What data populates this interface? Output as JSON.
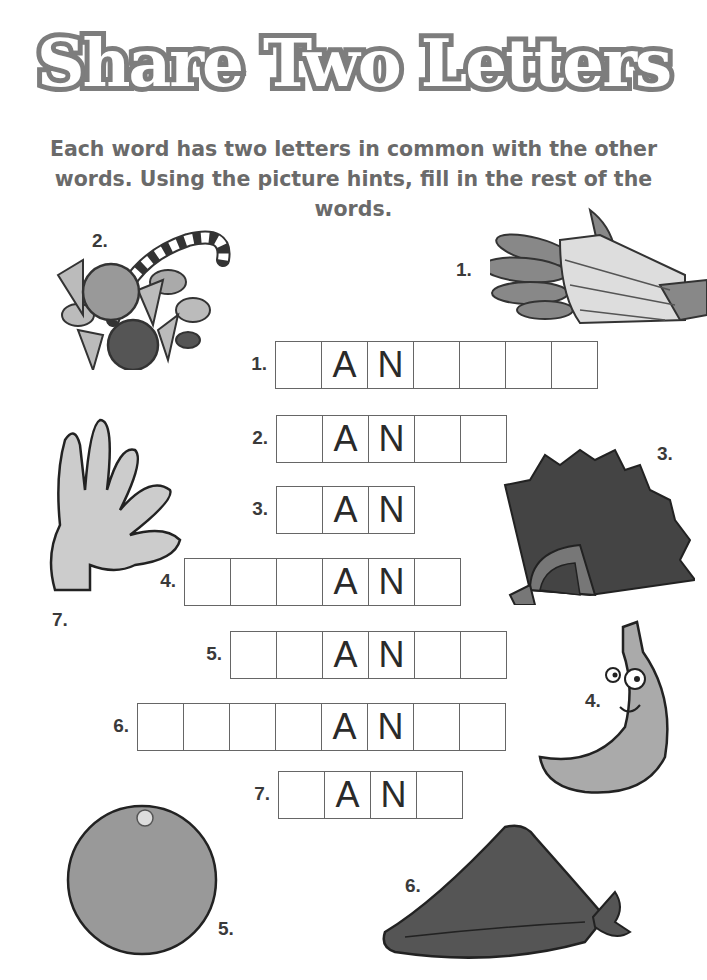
{
  "title": "Share Two Letters",
  "instructions": "Each word has two letters in common with the other words. Using the picture hints, fill in the rest of the words.",
  "puzzle": {
    "rows": [
      {
        "number": "1.",
        "cells": [
          "",
          "A",
          "N",
          "",
          "",
          "",
          ""
        ],
        "x": 275,
        "y": 341
      },
      {
        "number": "2.",
        "cells": [
          "",
          "A",
          "N",
          "",
          ""
        ],
        "x": 276,
        "y": 415
      },
      {
        "number": "3.",
        "cells": [
          "",
          "A",
          "N"
        ],
        "x": 276,
        "y": 486
      },
      {
        "number": "4.",
        "cells": [
          "",
          "",
          "",
          "A",
          "N",
          ""
        ],
        "x": 184,
        "y": 558
      },
      {
        "number": "5.",
        "cells": [
          "",
          "",
          "A",
          "N",
          "",
          ""
        ],
        "x": 230,
        "y": 631
      },
      {
        "number": "6.",
        "cells": [
          "",
          "",
          "",
          "",
          "A",
          "N",
          "",
          ""
        ],
        "x": 137,
        "y": 703
      },
      {
        "number": "7.",
        "cells": [
          "",
          "A",
          "N",
          ""
        ],
        "x": 278,
        "y": 771
      }
    ]
  },
  "pictures": [
    {
      "label": "1.",
      "hint": "bandaged-hand"
    },
    {
      "label": "2.",
      "hint": "candy"
    },
    {
      "label": "3.",
      "hint": "folding-fan"
    },
    {
      "label": "4.",
      "hint": "banana"
    },
    {
      "label": "5.",
      "hint": "orange"
    },
    {
      "label": "6.",
      "hint": "bandana"
    },
    {
      "label": "7.",
      "hint": "hand"
    }
  ]
}
